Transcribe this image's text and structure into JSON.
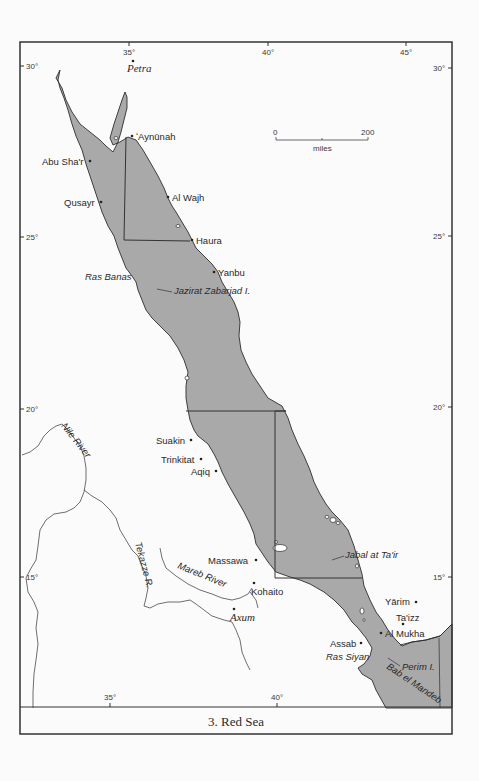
{
  "map": {
    "caption": "3. Red Sea",
    "colors": {
      "sea": "#a9a9a9",
      "land": "#ffffff",
      "line": "#2e2e2e",
      "page": "#fbfbfb"
    },
    "longitude_ticks_top": [
      "35°",
      "40°",
      "45°"
    ],
    "longitude_ticks_bottom": [
      "35°",
      "40°"
    ],
    "latitude_ticks_left": [
      "30°",
      "25°",
      "20°",
      "15°"
    ],
    "latitude_ticks_right": [
      "30°",
      "25°",
      "20°",
      "15°"
    ],
    "scale_bar": {
      "start": "0",
      "end": "200",
      "unit": "miles"
    },
    "places": {
      "petra": "Petra",
      "aynunah": "ʻAynūnah",
      "abu_shar": "Abu Sha'r",
      "al_wajh": "Al Wajh",
      "qusayr": "Qusayr",
      "haura": "Haura",
      "ras_banas": "Ras Banas",
      "yanbu": "Yanbu",
      "jazirat_zabarjad": "Jazirat Zabarjad I.",
      "suakin": "Suakin",
      "trinkitat": "Trinkitat",
      "aqiq": "Aqiq",
      "massawa": "Massawa",
      "kohaito": "Kohaito",
      "axum": "Axum",
      "jabal_at_tair": "Jabal at Ta'ir",
      "yarim": "Yārim",
      "taizz": "Ta'izz",
      "al_mukha": "Al Mukha",
      "assab": "Assab",
      "ras_siyan": "Ras Siyan",
      "perim": "Perim I.",
      "bab_el_mandeb": "Bab el Mandeb"
    },
    "rivers": {
      "nile": "Nile River",
      "tekazze": "Tekazze R.",
      "mareb": "Mareb River"
    }
  }
}
